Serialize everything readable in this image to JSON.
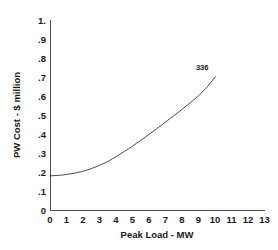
{
  "chart_data": {
    "type": "line",
    "title": "",
    "xlabel": "Peak Load - MW",
    "ylabel": "PW Cost - $ million",
    "xlim": [
      0,
      13
    ],
    "ylim": [
      0,
      1.0
    ],
    "grid": false,
    "legend": null,
    "xticks": [
      "0",
      "1",
      "2",
      "3",
      "4",
      "5",
      "6",
      "7",
      "8",
      "9",
      "10",
      "11",
      "12",
      "13"
    ],
    "xtick_values": [
      0,
      1,
      2,
      3,
      4,
      5,
      6,
      7,
      8,
      9,
      10,
      11,
      12,
      13
    ],
    "yticks": [
      "0",
      ".1",
      ".2",
      ".3",
      ".4",
      ".5",
      ".6",
      ".7",
      ".8",
      ".9",
      "1."
    ],
    "ytick_values": [
      0,
      0.1,
      0.2,
      0.3,
      0.4,
      0.5,
      0.6,
      0.7,
      0.8,
      0.9,
      1.0
    ],
    "series": [
      {
        "name": "PW Cost",
        "x": [
          0,
          0.5,
          1,
          1.5,
          2,
          2.5,
          3,
          3.5,
          4,
          4.5,
          5,
          5.5,
          6,
          6.5,
          7,
          7.5,
          8,
          8.5,
          9,
          9.5,
          10
        ],
        "values": [
          0.18,
          0.182,
          0.187,
          0.194,
          0.204,
          0.218,
          0.235,
          0.256,
          0.281,
          0.308,
          0.337,
          0.367,
          0.399,
          0.431,
          0.464,
          0.497,
          0.531,
          0.566,
          0.603,
          0.647,
          0.702
        ]
      }
    ],
    "annotations": [
      {
        "text": "336",
        "x": 9.2,
        "y": 0.735
      }
    ]
  }
}
